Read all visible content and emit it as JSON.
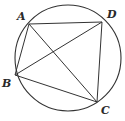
{
  "diagram": {
    "points": [
      {
        "id": "A",
        "label": "A"
      },
      {
        "id": "B",
        "label": "B"
      },
      {
        "id": "C",
        "label": "C"
      },
      {
        "id": "D",
        "label": "D"
      }
    ],
    "segments": [
      [
        "A",
        "D"
      ],
      [
        "D",
        "C"
      ],
      [
        "C",
        "B"
      ],
      [
        "B",
        "A"
      ],
      [
        "A",
        "C"
      ],
      [
        "B",
        "D"
      ]
    ],
    "colors": {
      "line": "#333333",
      "label": "#2a2a2a",
      "background": "#ffffff"
    }
  }
}
